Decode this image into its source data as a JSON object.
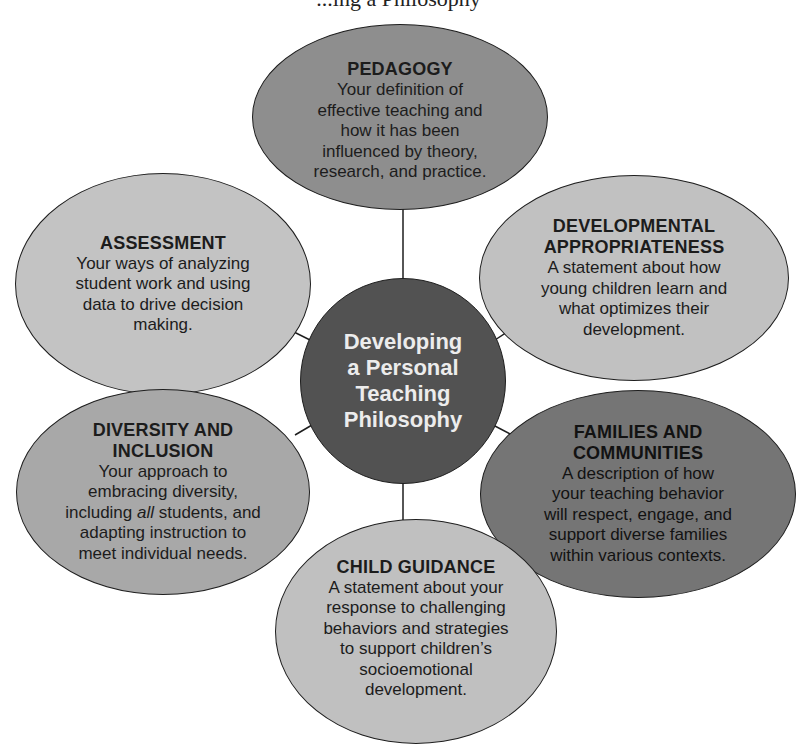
{
  "title_fragment": "...ing a Philosophy",
  "center": {
    "lines": [
      "Developing",
      "a Personal",
      "Teaching",
      "Philosophy"
    ],
    "color": "#525252",
    "text_color": "#ececec"
  },
  "nodes": {
    "pedagogy": {
      "title": "PEDAGOGY",
      "lines": [
        "Your definition of",
        "effective teaching and",
        "how it has been",
        "influenced by theory,",
        "research, and practice."
      ],
      "color": "#8e8e8e"
    },
    "assessment": {
      "title": "ASSESSMENT",
      "lines": [
        "Your ways of analyzing",
        "student work and using",
        "data to drive decision",
        "making."
      ],
      "color": "#c3c3c3"
    },
    "developmental": {
      "title_lines": [
        "DEVELOPMENTAL",
        "APPROPRIATENESS"
      ],
      "lines": [
        "A statement about how",
        "young children learn and",
        "what optimizes their",
        "development."
      ],
      "color": "#c1c1c1"
    },
    "diversity": {
      "title_lines": [
        "DIVERSITY AND",
        "INCLUSION"
      ],
      "lines": [
        "Your approach to",
        "embracing diversity,"
      ],
      "line_mixed": {
        "pre": "including ",
        "italic": "all",
        "post": " students, and"
      },
      "lines_after": [
        "adapting instruction to",
        "meet individual needs."
      ],
      "color": "#a8a8a8"
    },
    "families": {
      "title_lines": [
        "FAMILIES AND",
        "COMMUNITIES"
      ],
      "lines": [
        "A description of how",
        "your teaching behavior",
        "will respect, engage, and",
        "support diverse families",
        "within various contexts."
      ],
      "color": "#757575"
    },
    "guidance": {
      "title": "CHILD GUIDANCE",
      "lines": [
        "A statement about your",
        "response to challenging",
        "behaviors and strategies",
        "to support children’s",
        "socioemotional",
        "development."
      ],
      "color": "#c0c0c0"
    }
  }
}
